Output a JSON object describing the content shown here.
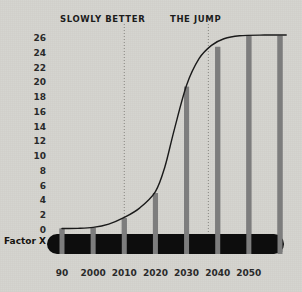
{
  "chart_data": {
    "type": "bar",
    "title": "",
    "subtitle": "",
    "xlabel": "",
    "ylabel": "",
    "series_label": "Factor X",
    "categories": [
      "90",
      "2000",
      "2010",
      "2020",
      "2030",
      "2040",
      "2050",
      ""
    ],
    "x_tick_labels": [
      "90",
      "2000",
      "2010",
      "2020",
      "2030",
      "2040",
      "2050"
    ],
    "y_tick_labels": [
      "26",
      "24",
      "22",
      "20",
      "18",
      "16",
      "14",
      "12",
      "10",
      "8",
      "6",
      "4",
      "2",
      "0"
    ],
    "y_tick_values": [
      26,
      24,
      22,
      20,
      18,
      16,
      14,
      12,
      10,
      8,
      6,
      4,
      2,
      0
    ],
    "ylim": [
      0,
      27
    ],
    "xlim": [
      1990,
      2060
    ],
    "grid": false,
    "legend": "none",
    "bars": [
      {
        "x": 1990,
        "label": "90",
        "value": 0.2
      },
      {
        "x": 2000,
        "label": "2000",
        "value": 0.3
      },
      {
        "x": 2010,
        "label": "2010",
        "value": 1.6
      },
      {
        "x": 2020,
        "label": "2020",
        "value": 5.0
      },
      {
        "x": 2030,
        "label": "2030",
        "value": 19.4
      },
      {
        "x": 2040,
        "label": "2040",
        "value": 24.8
      },
      {
        "x": 2050,
        "label": "2050",
        "value": 26.3
      },
      {
        "x": 2060,
        "label": "",
        "value": 26.3
      }
    ],
    "values": [
      0.2,
      0.3,
      1.6,
      5.0,
      19.4,
      24.8,
      26.3,
      26.3
    ],
    "curve": {
      "name": "S-curve trend",
      "points": [
        {
          "x": 1990,
          "y": 0.2
        },
        {
          "x": 1995,
          "y": 0.22
        },
        {
          "x": 2000,
          "y": 0.35
        },
        {
          "x": 2005,
          "y": 0.8
        },
        {
          "x": 2010,
          "y": 1.7
        },
        {
          "x": 2015,
          "y": 3.0
        },
        {
          "x": 2020,
          "y": 5.2
        },
        {
          "x": 2023,
          "y": 8.5
        },
        {
          "x": 2026,
          "y": 13.5
        },
        {
          "x": 2030,
          "y": 19.6
        },
        {
          "x": 2034,
          "y": 23.2
        },
        {
          "x": 2038,
          "y": 25.0
        },
        {
          "x": 2042,
          "y": 25.9
        },
        {
          "x": 2047,
          "y": 26.3
        },
        {
          "x": 2055,
          "y": 26.4
        },
        {
          "x": 2062,
          "y": 26.4
        }
      ]
    },
    "annotations": [
      {
        "name": "slowly-better",
        "text": "SLOWLY BETTER",
        "x": 2010,
        "label_x": 60,
        "label_y": 14
      },
      {
        "name": "the-jump",
        "text": "THE JUMP",
        "x": 2037,
        "label_x": 170,
        "label_y": 14
      }
    ],
    "markers": [
      {
        "name": "dotted-line-slowly-better",
        "x": 2010
      },
      {
        "name": "dotted-line-the-jump",
        "x": 2037
      }
    ],
    "colors": {
      "background": "#d5d3ce",
      "bar": "#7d7d7d",
      "curve": "#1a1a1a",
      "baseline": "#0d0d0d",
      "text": "#1c1c1c",
      "dotted_marker": "#8d8b86"
    }
  }
}
